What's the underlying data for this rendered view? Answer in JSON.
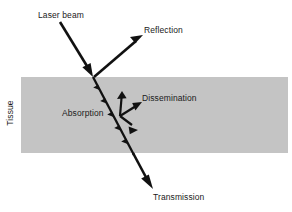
{
  "diagram": {
    "background_color": "#ffffff",
    "stroke_color": "#111111",
    "text_color": "#1a1a1a",
    "tissue": {
      "label": "Tissue",
      "fill_color": "#c4c4c4",
      "x": 21,
      "y": 77,
      "width": 267,
      "height": 76
    },
    "labels": {
      "laser_beam": "Laser beam",
      "reflection": "Reflection",
      "dissemination": "Dissemination",
      "absorption": "Absorption",
      "transmission": "Transmission",
      "tissue": "Tissue"
    },
    "arrows": [
      {
        "name": "incident-laser-beam",
        "label": "Laser beam",
        "from": [
          60,
          22
        ],
        "to": [
          93,
          76
        ],
        "style": "solid",
        "width": 2.6
      },
      {
        "name": "reflection-beam",
        "label": "Reflection",
        "from": [
          94,
          77
        ],
        "to": [
          142,
          36
        ],
        "style": "solid",
        "width": 2.6
      },
      {
        "name": "absorption-beam-in-tissue",
        "label": "Absorption",
        "from": [
          93,
          77
        ],
        "to": [
          136,
          158
        ],
        "style": "chevroned",
        "width": 2.2
      },
      {
        "name": "transmission-beam",
        "label": "Transmission",
        "from": [
          134,
          155
        ],
        "to": [
          152,
          188
        ],
        "style": "solid",
        "width": 2.6
      },
      {
        "name": "dissemination-up",
        "label": "Dissemination",
        "from": [
          120,
          116
        ],
        "to": [
          122,
          92
        ],
        "style": "solid",
        "width": 2.2
      },
      {
        "name": "dissemination-up-right",
        "label": "Dissemination",
        "from": [
          120,
          116
        ],
        "to": [
          141,
          103
        ],
        "style": "solid",
        "width": 2.2
      },
      {
        "name": "dissemination-down-right",
        "label": "Dissemination",
        "from": [
          120,
          116
        ],
        "to": [
          137,
          129
        ],
        "style": "solid",
        "width": 2.2
      }
    ]
  }
}
